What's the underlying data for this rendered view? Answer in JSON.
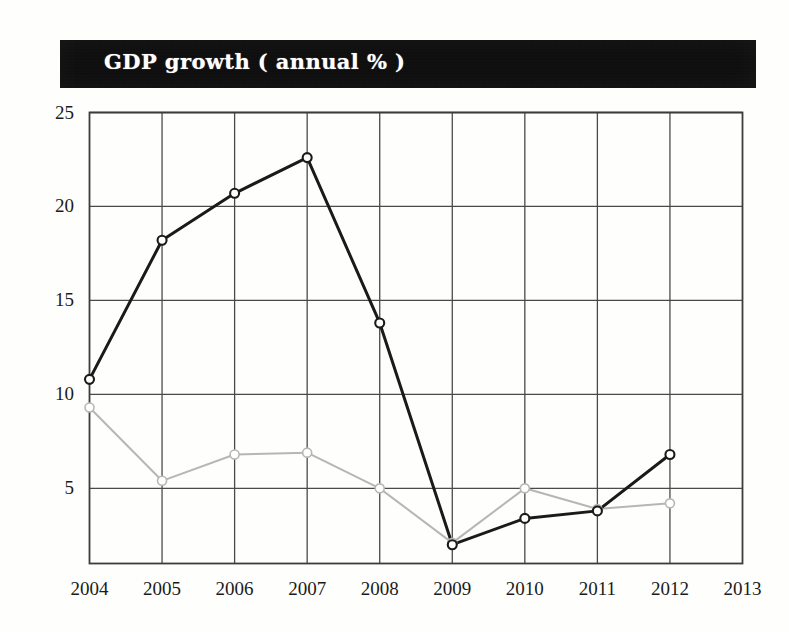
{
  "title": {
    "text": "GDP growth ( annual % )",
    "banner_color": "#0d0d0d",
    "text_color": "#ffffff"
  },
  "chart_data": {
    "type": "line",
    "title": "GDP growth ( annual % )",
    "xlabel": "",
    "ylabel": "",
    "x": [
      2004,
      2005,
      2006,
      2007,
      2008,
      2009,
      2010,
      2011,
      2012,
      2013
    ],
    "categories": [
      "2004",
      "2005",
      "2006",
      "2007",
      "2008",
      "2009",
      "2010",
      "2011",
      "2012",
      "2013"
    ],
    "yticks": [
      5,
      10,
      15,
      20,
      25
    ],
    "ytick_labels": [
      "5",
      "10",
      "15",
      "20",
      "25"
    ],
    "ylim": [
      1.0,
      25.0
    ],
    "xlim": [
      2004,
      2013
    ],
    "grid": true,
    "legend": "none",
    "marker": "open-circle",
    "series": [
      {
        "name": "series-dark",
        "color": "#1a1a1a",
        "line_width": 3,
        "marker_size": 9,
        "x": [
          2004,
          2005,
          2006,
          2007,
          2008,
          2009,
          2010,
          2011,
          2012
        ],
        "values": [
          10.8,
          18.2,
          20.7,
          22.6,
          13.8,
          2.0,
          3.4,
          3.8,
          6.8
        ]
      },
      {
        "name": "series-light",
        "color": "#b6b6b6",
        "line_width": 2,
        "marker_size": 9,
        "x": [
          2004,
          2005,
          2006,
          2007,
          2008,
          2009,
          2010,
          2011,
          2012
        ],
        "values": [
          9.3,
          5.4,
          6.8,
          6.9,
          5.0,
          2.1,
          5.0,
          3.9,
          4.2
        ]
      }
    ]
  },
  "axes": {
    "y_labels": [
      "25",
      "20",
      "15",
      "10",
      "5"
    ],
    "x_labels": [
      "2004",
      "2005",
      "2006",
      "2007",
      "2008",
      "2009",
      "2010",
      "2011",
      "2012",
      "2013"
    ]
  }
}
